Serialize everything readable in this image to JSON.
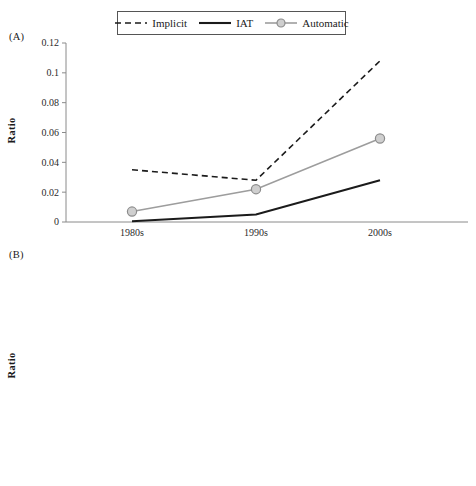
{
  "figure": {
    "panel_a_label": "(A)",
    "panel_b_label": "(B)"
  },
  "legend": {
    "position": "top-center",
    "entries": [
      {
        "label": "Implicit",
        "style": "dashed-black",
        "color": "#1b1b1b",
        "marker": "none"
      },
      {
        "label": "IAT",
        "style": "solid-black",
        "color": "#1b1b1b",
        "marker": "none"
      },
      {
        "label": "Automatic",
        "style": "solid-gray",
        "color": "#9d9d9d",
        "marker": "circle"
      }
    ]
  },
  "colors": {
    "implicit": "#1b1b1b",
    "iat": "#1b1b1b",
    "automatic": "#9d9d9d",
    "marker_fill": "#cfcfcf",
    "marker_stroke": "#8c8c8c",
    "axis": "#8a8a8a",
    "text": "#2b2b2b",
    "background": "#ffffff"
  },
  "chart_data": [
    {
      "type": "line",
      "panel": "(A)",
      "title": "",
      "xlabel": "",
      "ylabel": "Ratio",
      "categories": [
        "1980s",
        "1990s",
        "2000s"
      ],
      "ylim": [
        0,
        0.12
      ],
      "yticks": [
        0,
        0.02,
        0.04,
        0.06,
        0.08,
        0.1,
        0.12
      ],
      "ytick_labels": [
        "0",
        "0.02",
        "0.04",
        "0.06",
        "0.08",
        "0.1",
        "0.12"
      ],
      "grid": false,
      "legend_position": "top-center",
      "series": [
        {
          "name": "Implicit",
          "values": [
            0.035,
            0.028,
            0.108
          ]
        },
        {
          "name": "IAT",
          "values": [
            0.0005,
            0.005,
            0.028
          ]
        },
        {
          "name": "Automatic",
          "values": [
            0.007,
            0.022,
            0.056
          ]
        }
      ]
    },
    {
      "type": "line",
      "panel": "(B)",
      "title": "",
      "xlabel": "",
      "ylabel": "Ratio",
      "categories": [
        "1980s",
        "1990s",
        "2000s"
      ],
      "ylim": [
        0,
        0.07
      ],
      "yticks": [
        0,
        0.01,
        0.02,
        0.03,
        0.04,
        0.05,
        0.06,
        0.07
      ],
      "ytick_labels": [
        "0",
        "0.01",
        "0.02",
        "0.03",
        "0.04",
        "0.05",
        "0.06",
        "0.07"
      ],
      "grid": false,
      "legend_position": "none",
      "series": [
        {
          "name": "Implicit",
          "values": [
            0.026,
            0.034,
            0.057
          ]
        },
        {
          "name": "IAT",
          "values": [
            0.0002,
            0.001,
            0.019
          ]
        },
        {
          "name": "Automatic",
          "values": [
            0.01,
            0.0125,
            0.031
          ]
        }
      ]
    }
  ]
}
